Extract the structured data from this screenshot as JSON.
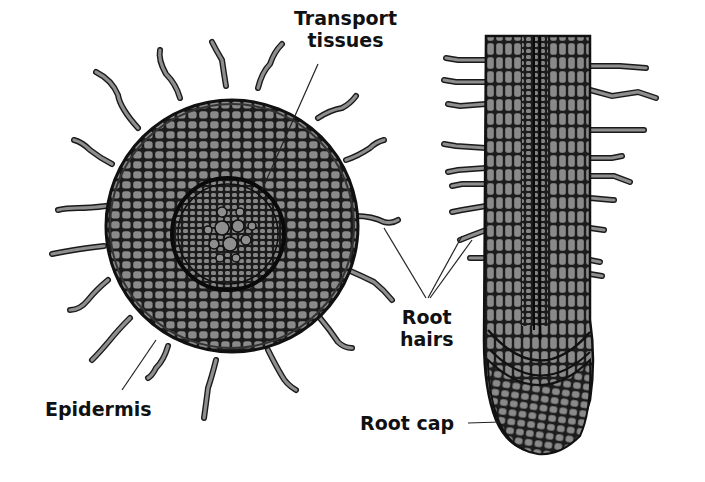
{
  "diagram": {
    "title": "",
    "views": [
      {
        "id": "cross-section",
        "description": "Cross-section of root"
      },
      {
        "id": "longitudinal-section",
        "description": "Longitudinal section of root tip"
      }
    ],
    "labels": {
      "transport_line1": "Transport",
      "transport_line2": "tissues",
      "root_hairs_line1": "Root",
      "root_hairs_line2": "hairs",
      "epidermis": "Epidermis",
      "root_cap": "Root cap"
    },
    "colors": {
      "tissue_fill": "#7a7a7a",
      "cell_fill": "#8c8c8c",
      "cell_wall": "#1a1a1a",
      "leader_line": "#222222",
      "background": "#ffffff"
    }
  }
}
